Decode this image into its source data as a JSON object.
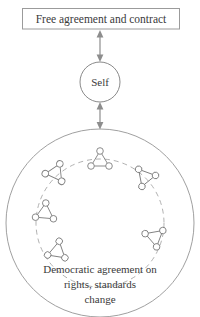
{
  "diagram": {
    "type": "concentric-relationship-diagram",
    "background_color": "#ffffff",
    "line_color": "#8d8d8d",
    "text_color": "#3a3a3a",
    "top_box": {
      "label": "Free agreement and contract"
    },
    "center_node": {
      "label": "Self"
    },
    "caption": {
      "line1": "Democratic agreement on",
      "line2": "rights, standards",
      "line3": "change"
    },
    "connectors": [
      {
        "name": "box-to-self",
        "style": "double-headed-arrow"
      },
      {
        "name": "self-to-community",
        "style": "double-headed-arrow"
      }
    ],
    "outer_circle": {
      "name": "community-boundary",
      "style": "solid"
    },
    "inner_circle": {
      "name": "group-orbit",
      "style": "dashed"
    },
    "clusters": [
      {
        "name": "group-cluster-top",
        "cx": 100,
        "cy": 160,
        "rotation": 0
      },
      {
        "name": "group-cluster-upper-left",
        "cx": 56,
        "cy": 172,
        "rotation": 25
      },
      {
        "name": "group-cluster-upper-right",
        "cx": 145,
        "cy": 178,
        "rotation": 200
      },
      {
        "name": "group-cluster-left",
        "cx": 45,
        "cy": 212,
        "rotation": 5
      },
      {
        "name": "group-cluster-lower-right",
        "cx": 155,
        "cy": 238,
        "rotation": 170
      },
      {
        "name": "group-cluster-lower-left",
        "cx": 58,
        "cy": 252,
        "rotation": 130
      }
    ]
  }
}
